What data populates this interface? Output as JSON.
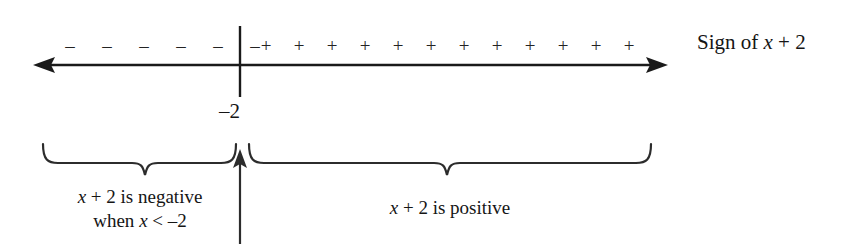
{
  "figure": {
    "type": "sign-chart-number-line",
    "background_color": "#ffffff",
    "ink_color": "#1a1a1a"
  },
  "number_line": {
    "left_arrow": "left-arrowhead",
    "right_arrow": "right-arrowhead",
    "y": 65,
    "x_start": 33,
    "x_end": 668,
    "critical_point": {
      "label": "–2",
      "value": -2,
      "x": 240,
      "tick_top": 26,
      "tick_bottom": 97
    }
  },
  "signs": {
    "negative_region": {
      "glyph": "–",
      "count": 6,
      "glyphs": [
        "–",
        "–",
        "–",
        "–",
        "–",
        "–"
      ]
    },
    "positive_region": {
      "glyph": "+",
      "count": 12,
      "glyphs": [
        "+",
        "+",
        "+",
        "+",
        "+",
        "+",
        "+",
        "+",
        "+",
        "+",
        "+",
        "+"
      ]
    }
  },
  "labels": {
    "axis_label": {
      "prefix": "Sign of ",
      "variable": "x",
      "suffix": " + 2",
      "full_text": "Sign of x + 2"
    },
    "left_caption": {
      "line1_prefix": "",
      "line1_variable": "x",
      "line1_suffix": " + 2 is negative",
      "line2_prefix": "when ",
      "line2_variable": "x",
      "line2_suffix": " < –2",
      "full_text": "x + 2 is negative when x < –2"
    },
    "right_caption": {
      "prefix": "",
      "variable": "x",
      "suffix": " + 2 is positive",
      "full_text": "x + 2 is positive"
    }
  },
  "braces": {
    "left": {
      "x_start": 43,
      "x_end": 236,
      "center": 145,
      "top": 144,
      "depth": 20
    },
    "right": {
      "x_start": 249,
      "x_end": 651,
      "center": 447,
      "top": 144,
      "depth": 20
    }
  },
  "pointer_arrow": {
    "name": "upward-pointer-to-critical-point",
    "x": 240,
    "y_bottom": 244,
    "y_top": 152
  }
}
